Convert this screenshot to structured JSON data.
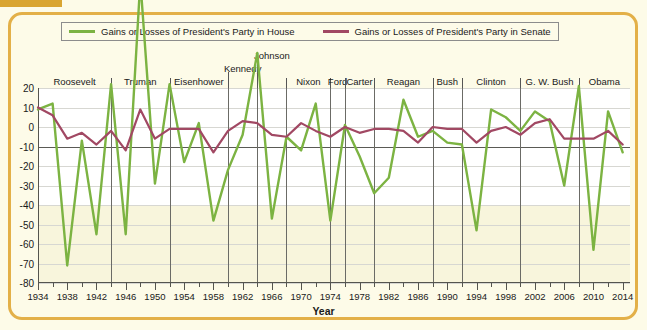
{
  "frame": {
    "accent_color": "#e3b048",
    "tab_color": "#d9a531"
  },
  "legend": {
    "items": [
      {
        "label": "Gains or Losses of President's Party in House",
        "color": "#7cb342",
        "icon": "line-swatch-icon"
      },
      {
        "label": "Gains or Losses of President's Party in Senate",
        "color": "#a14863",
        "icon": "line-swatch-icon"
      }
    ]
  },
  "axes": {
    "x_title": "Year",
    "y_ticks": [
      "20",
      "10",
      "0",
      "-10",
      "-20",
      "-30",
      "-40",
      "-50",
      "-60",
      "-70",
      "-80"
    ],
    "x_ticks": [
      "1934",
      "1938",
      "1942",
      "1946",
      "1950",
      "1954",
      "1958",
      "1962",
      "1966",
      "1970",
      "1974",
      "1978",
      "1982",
      "1986",
      "1990",
      "1994",
      "1998",
      "2002",
      "2006",
      "2010",
      "2014"
    ]
  },
  "presidents": [
    {
      "name": "Roosevelt",
      "start": 1934,
      "end": 1944
    },
    {
      "name": "Truman",
      "start": 1944,
      "end": 1952
    },
    {
      "name": "Eisenhower",
      "start": 1952,
      "end": 1960
    },
    {
      "name": "Kennedy",
      "start": 1960,
      "end": 1964
    },
    {
      "name": "Johnson",
      "start": 1964,
      "end": 1968
    },
    {
      "name": "Nixon",
      "start": 1968,
      "end": 1974
    },
    {
      "name": "Ford",
      "start": 1974,
      "end": 1976
    },
    {
      "name": "Carter",
      "start": 1976,
      "end": 1980
    },
    {
      "name": "Reagan",
      "start": 1980,
      "end": 1988
    },
    {
      "name": "Bush",
      "start": 1988,
      "end": 1992
    },
    {
      "name": "Clinton",
      "start": 1992,
      "end": 2000
    },
    {
      "name": "G. W. Bush",
      "start": 2000,
      "end": 2008
    },
    {
      "name": "Obama",
      "start": 2008,
      "end": 2015
    }
  ],
  "chart_data": {
    "type": "line",
    "title": "",
    "xlabel": "Year",
    "ylabel": "",
    "xlim": [
      1934,
      2015
    ],
    "ylim": [
      -80,
      20
    ],
    "ytick_step": 10,
    "xtick_step": 4,
    "minor_xtick_step": 2,
    "grid": true,
    "legend_position": "top",
    "x": [
      1934,
      1936,
      1938,
      1940,
      1942,
      1944,
      1946,
      1948,
      1950,
      1952,
      1954,
      1956,
      1958,
      1960,
      1962,
      1964,
      1966,
      1968,
      1970,
      1972,
      1974,
      1976,
      1978,
      1980,
      1982,
      1984,
      1986,
      1988,
      1990,
      1992,
      1994,
      1996,
      1998,
      2000,
      2002,
      2004,
      2006,
      2008,
      2010,
      2012,
      2014
    ],
    "series": [
      {
        "name": "Gains or Losses of President's Party in House",
        "color": "#7cb342",
        "values": [
          9,
          12,
          -71,
          -7,
          -55,
          22,
          -55,
          75,
          -29,
          22,
          -18,
          2,
          -48,
          -22,
          -4,
          38,
          -47,
          -5,
          -12,
          12,
          -48,
          1,
          -15,
          -34,
          -26,
          14,
          -5,
          -2,
          -8,
          -9,
          -53,
          9,
          5,
          -2,
          8,
          3,
          -30,
          21,
          -63,
          8,
          -13
        ]
      },
      {
        "name": "Gains or Losses of President's Party in Senate",
        "color": "#a14863",
        "values": [
          10,
          6,
          -6,
          -3,
          -9,
          -2,
          -12,
          9,
          -6,
          -1,
          -1,
          -1,
          -13,
          -2,
          3,
          2,
          -4,
          -5,
          2,
          -2,
          -5,
          0,
          -3,
          -1,
          -1,
          -2,
          -8,
          0,
          -1,
          -1,
          -8,
          -2,
          0,
          -4,
          2,
          4,
          -6,
          -6,
          -6,
          -2,
          -9
        ]
      }
    ]
  }
}
